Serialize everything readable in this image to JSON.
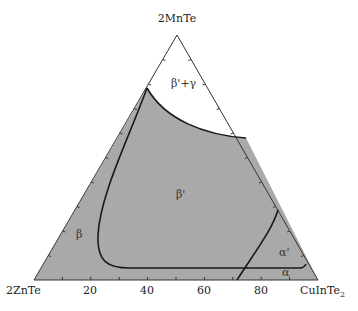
{
  "diagram": {
    "type": "ternary-phase-diagram",
    "vertices": {
      "top": "2MnTe",
      "left": "2ZnTe",
      "right": "CuInTe",
      "right_subscript": "2"
    },
    "base_ticks": [
      "20",
      "40",
      "60",
      "80"
    ],
    "tick_interval_percent": 10,
    "phase_regions": [
      {
        "label": "β'+γ",
        "fill": "#ffffff"
      },
      {
        "label": "β'",
        "fill": "#a9a9a9"
      },
      {
        "label": "β",
        "fill": "#a9a9a9"
      },
      {
        "label": "α'",
        "fill": "#a9a9a9"
      },
      {
        "label": "α",
        "fill": "#a9a9a9"
      }
    ],
    "colors": {
      "region_fill": "#a9a9a9",
      "boundary": "#1a1a1a",
      "edge": "#333333"
    }
  }
}
